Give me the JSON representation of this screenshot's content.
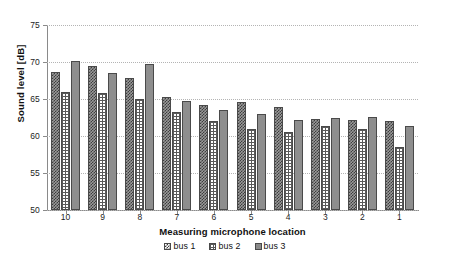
{
  "chart_data": {
    "type": "bar",
    "title": "",
    "xlabel": "Measuring microphone location",
    "ylabel": "Sound level [dB]",
    "categories": [
      "10",
      "9",
      "8",
      "7",
      "6",
      "5",
      "4",
      "3",
      "2",
      "1"
    ],
    "series": [
      {
        "name": "bus 1",
        "values": [
          68.6,
          69.4,
          67.8,
          65.3,
          64.2,
          64.6,
          63.9,
          62.3,
          62.2,
          62.0
        ]
      },
      {
        "name": "bus 2",
        "values": [
          66.0,
          65.8,
          65.0,
          63.3,
          62.0,
          61.0,
          60.5,
          61.3,
          61.0,
          58.5
        ]
      },
      {
        "name": "bus 3",
        "values": [
          70.2,
          68.5,
          69.7,
          64.7,
          63.5,
          63.0,
          62.1,
          62.5,
          62.6,
          61.4
        ]
      }
    ],
    "ylim": [
      50,
      75
    ],
    "yticks": [
      "50",
      "55",
      "60",
      "65",
      "70",
      "75"
    ],
    "grid": true,
    "legend_position": "bottom",
    "legend": [
      "bus 1",
      "bus 2",
      "bus 3"
    ],
    "colors": {
      "bus1": "#3d3d3d",
      "bus2": "#5a5a5a",
      "bus3": "#8a8a8a",
      "gridline": "#b4b4b4",
      "axis": "#8a8a8a"
    },
    "patterns": {
      "bus1": "checkerboard",
      "bus2": "grid",
      "bus3": "solid"
    }
  }
}
